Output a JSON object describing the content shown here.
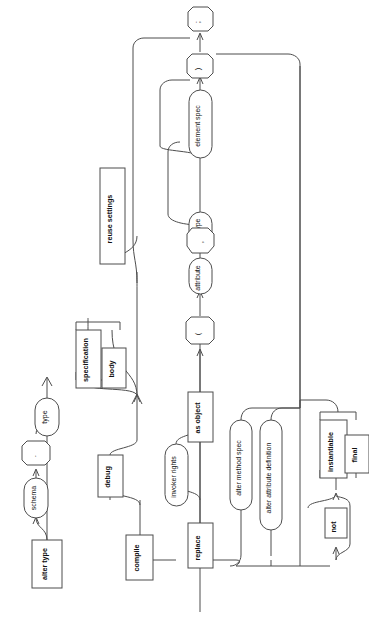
{
  "diagram": {
    "title": "alter type",
    "kind": "railroad-syntax-diagram",
    "orientation": "rotated-90-ccw",
    "stroke_color": "#4d4d4d",
    "background_color": "#ffffff",
    "text_color": "#111111",
    "nodes": [
      {
        "id": "alter_type",
        "label": "alter type",
        "shape": "rect"
      },
      {
        "id": "schema",
        "label": "schema",
        "shape": "round"
      },
      {
        "id": "dot",
        "label": ".",
        "shape": "oct"
      },
      {
        "id": "type",
        "label": "type",
        "shape": "round"
      },
      {
        "id": "compile",
        "label": "compile",
        "shape": "rect"
      },
      {
        "id": "debug",
        "label": "debug",
        "shape": "rect"
      },
      {
        "id": "specification",
        "label": "specification",
        "shape": "rect"
      },
      {
        "id": "body",
        "label": "body",
        "shape": "rect"
      },
      {
        "id": "reuse_settings",
        "label": "reuse settings",
        "shape": "rect"
      },
      {
        "id": "replace",
        "label": "replace",
        "shape": "rect"
      },
      {
        "id": "invoker_rights",
        "label": "invoker rights",
        "shape": "round"
      },
      {
        "id": "as_object",
        "label": "as object",
        "shape": "rect"
      },
      {
        "id": "lparen",
        "label": "(",
        "shape": "oct"
      },
      {
        "id": "attribute",
        "label": "attribute",
        "shape": "round"
      },
      {
        "id": "datatype",
        "label": "datatype",
        "shape": "round"
      },
      {
        "id": "comma",
        "label": ",",
        "shape": "oct"
      },
      {
        "id": "element_spec",
        "label": "element spec",
        "shape": "round"
      },
      {
        "id": "rparen",
        "label": ")",
        "shape": "oct"
      },
      {
        "id": "semicolon",
        "label": ";",
        "shape": "oct"
      },
      {
        "id": "alter_method_spec",
        "label": "alter method spec",
        "shape": "round"
      },
      {
        "id": "alter_attribute_definition",
        "label": "alter attribute definition",
        "shape": "round"
      },
      {
        "id": "not",
        "label": "not",
        "shape": "rect"
      },
      {
        "id": "instantiable",
        "label": "instantiable",
        "shape": "rect"
      },
      {
        "id": "final",
        "label": "final",
        "shape": "rect"
      }
    ]
  }
}
